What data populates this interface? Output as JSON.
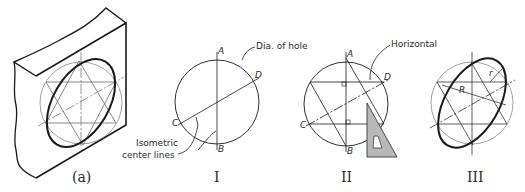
{
  "figure": {
    "panels": [
      {
        "id": "a",
        "caption": "(a)"
      },
      {
        "id": "I",
        "caption": "I"
      },
      {
        "id": "II",
        "caption": "II"
      },
      {
        "id": "III",
        "caption": "III"
      }
    ],
    "labels": {
      "dia_of_hole": "Dia. of hole",
      "isometric_line1": "Isometric",
      "isometric_line2": "center lines",
      "horizontal": "Horizontal",
      "R": "R",
      "r": "r"
    },
    "points": {
      "I": {
        "A": "A",
        "B": "B",
        "C": "C",
        "D": "D"
      },
      "II": {
        "A": "A",
        "B": "B",
        "C": "C",
        "D": "D"
      }
    },
    "colors": {
      "line": "#1a1a1a",
      "construction": "#8a8a8a",
      "triangle_fill": "#b8b8b8"
    }
  }
}
